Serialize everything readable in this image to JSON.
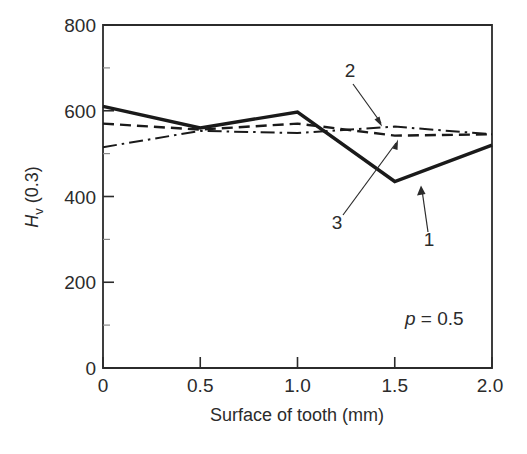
{
  "chart_data": {
    "type": "line",
    "title": "",
    "subtitle": "",
    "xlabel": "Surface of tooth (mm)",
    "ylabel": "H_v (0.3)",
    "ylabel_main": "H",
    "ylabel_sub": "v",
    "ylabel_tail": " (0.3)",
    "xlim": [
      0,
      2.0
    ],
    "ylim": [
      0,
      800
    ],
    "xticks": [
      0,
      0.5,
      1.0,
      1.5,
      2.0
    ],
    "xtick_labels": [
      "0",
      "0.5",
      "1.0",
      "1.5",
      "2.0"
    ],
    "yticks": [
      0,
      200,
      400,
      600,
      800
    ],
    "ytick_labels": [
      "0",
      "200",
      "400",
      "600",
      "800"
    ],
    "x_minor_ticks": [],
    "y_minor_ticks": [
      100,
      300,
      500,
      700
    ],
    "grid": false,
    "legend": "none",
    "x": [
      0,
      0.5,
      1.0,
      1.5,
      2.0
    ],
    "series": [
      {
        "name": "1",
        "style": "solid",
        "label": "1",
        "values": [
          610,
          560,
          597,
          435,
          520
        ]
      },
      {
        "name": "2",
        "style": "dash-dot",
        "label": "2",
        "values": [
          515,
          553,
          548,
          563,
          545
        ]
      },
      {
        "name": "3",
        "style": "dashed",
        "label": "3",
        "values": [
          570,
          556,
          570,
          542,
          545
        ]
      }
    ],
    "annotations": [
      {
        "text": "2",
        "target_series": "2",
        "x_label": 1.47,
        "y_label": 690
      },
      {
        "text": "3",
        "target_series": "3",
        "x_label": 1.23,
        "y_label": 345
      },
      {
        "text": "1",
        "target_series": "1",
        "x_label": 1.7,
        "y_label": 310
      },
      {
        "text": "p = 0.5",
        "x_label": 1.58,
        "y_label": 120
      }
    ],
    "param": {
      "symbol": "p",
      "equals": " = ",
      "value": "0.5"
    },
    "colors": {
      "line": "#1a1a1a",
      "axis": "#2b2b2b",
      "background": "#ffffff"
    }
  }
}
